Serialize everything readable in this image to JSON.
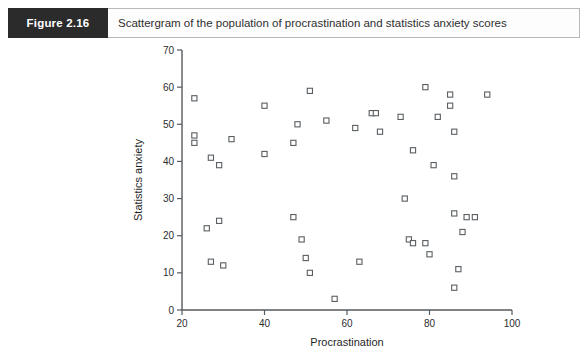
{
  "figure": {
    "tag": "Figure 2.16",
    "caption": "Scattergram of the population of procrastination and statistics anxiety scores"
  },
  "colors": {
    "tag_background": "#2b2b2b",
    "tag_text": "#ffffff",
    "caption_text": "#2f2f2f",
    "axis": "#555a5e",
    "marker_stroke": "#5a5f63",
    "marker_fill": "#ffffff",
    "page_background": "#ffffff",
    "panel_border": "#b9b9b9"
  },
  "chart_data": {
    "type": "scatter",
    "title": "Scattergram of the population of procrastination and statistics anxiety scores",
    "xlabel": "Procrastination",
    "ylabel": "Statistics anxiety",
    "xlim": [
      20,
      100
    ],
    "ylim": [
      0,
      70
    ],
    "xticks": [
      20,
      40,
      60,
      80,
      100
    ],
    "yticks": [
      0,
      10,
      20,
      30,
      40,
      50,
      60,
      70
    ],
    "grid": false,
    "legend": null,
    "marker": "open-square",
    "points": [
      [
        23,
        57
      ],
      [
        23,
        47
      ],
      [
        23,
        45
      ],
      [
        27,
        41
      ],
      [
        29,
        39
      ],
      [
        26,
        22
      ],
      [
        29,
        24
      ],
      [
        27,
        13
      ],
      [
        30,
        12
      ],
      [
        32,
        46
      ],
      [
        40,
        42
      ],
      [
        40,
        55
      ],
      [
        47,
        45
      ],
      [
        47,
        25
      ],
      [
        48,
        50
      ],
      [
        49,
        19
      ],
      [
        50,
        14
      ],
      [
        51,
        59
      ],
      [
        51,
        10
      ],
      [
        55,
        51
      ],
      [
        57,
        3
      ],
      [
        62,
        49
      ],
      [
        63,
        13
      ],
      [
        66,
        53
      ],
      [
        67,
        53
      ],
      [
        68,
        48
      ],
      [
        73,
        52
      ],
      [
        74,
        30
      ],
      [
        75,
        19
      ],
      [
        76,
        18
      ],
      [
        76,
        43
      ],
      [
        79,
        18
      ],
      [
        79,
        60
      ],
      [
        80,
        15
      ],
      [
        81,
        39
      ],
      [
        82,
        52
      ],
      [
        85,
        58
      ],
      [
        85,
        55
      ],
      [
        86,
        48
      ],
      [
        86,
        36
      ],
      [
        86,
        26
      ],
      [
        86,
        6
      ],
      [
        87,
        11
      ],
      [
        88,
        21
      ],
      [
        89,
        25
      ],
      [
        91,
        25
      ],
      [
        94,
        58
      ]
    ]
  }
}
